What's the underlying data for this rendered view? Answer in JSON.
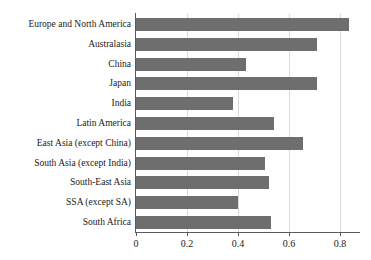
{
  "chart_data": {
    "type": "bar",
    "orientation": "horizontal",
    "title": "",
    "xlabel": "",
    "ylabel": "",
    "xlim": [
      0,
      0.878
    ],
    "grid": "vertical-only",
    "legend": "none",
    "bar_color": "#6e6e6e",
    "axis_color": "#5a5a5a",
    "grid_color": "#d9d9d9",
    "background": "#ffffff",
    "xticks": [
      0,
      0.2,
      0.4,
      0.6,
      0.8
    ],
    "xtick_labels": [
      "0",
      "0.2",
      "0.4",
      "0.6",
      "0.8"
    ],
    "categories": [
      "Europe and North America",
      "Australasia",
      "China",
      "Japan",
      "India",
      "Latin America",
      "East Asia (except China)",
      "South Asia (except India)",
      "South-East Asia",
      "SSA (except SA)",
      "South Africa"
    ],
    "values": [
      0.835,
      0.71,
      0.43,
      0.71,
      0.38,
      0.54,
      0.655,
      0.505,
      0.52,
      0.4,
      0.53
    ]
  }
}
